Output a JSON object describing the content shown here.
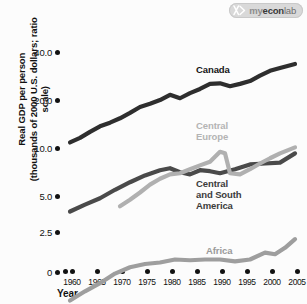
{
  "logo": {
    "icon": "myeconlab-mark-icon",
    "text_my": "my",
    "text_econ": "econ",
    "text_lab": "lab"
  },
  "chart_data": {
    "type": "line",
    "title": "",
    "xlabel": "Year",
    "ylabel": "Real GDP per person\n(thousands of 2000 U.S. dollars; ratio scale)",
    "ylabel_line1": "Real GDP per person",
    "ylabel_line2": "(thousands of 2000 U.S. dollars; ratio scale)",
    "scale": "ratio (logarithmic) y-axis",
    "grid": false,
    "legend_position": "inline labels next to series",
    "ytick_labels": [
      "0",
      "2.5",
      "5.0",
      "10.0",
      "20.0",
      "40.0"
    ],
    "ytick_values": [
      0,
      2.5,
      5.0,
      10.0,
      20.0,
      40.0
    ],
    "ylim": [
      0,
      40
    ],
    "xtick_labels": [
      "1960",
      "1965",
      "1970",
      "1975",
      "1980",
      "1985",
      "1990",
      "1995",
      "2000",
      "2005"
    ],
    "x": [
      1960,
      1965,
      1970,
      1975,
      1980,
      1985,
      1990,
      1995,
      2000,
      2005
    ],
    "xlim": [
      1960,
      2005
    ],
    "series": [
      {
        "name": "Canada",
        "color": "#2e2e2e",
        "x": [
          1960,
          1962,
          1964,
          1966,
          1968,
          1970,
          1972,
          1974,
          1976,
          1978,
          1980,
          1982,
          1984,
          1986,
          1988,
          1990,
          1992,
          1994,
          1996,
          1998,
          2000,
          2002,
          2005
        ],
        "values": [
          10.3,
          11.0,
          12.0,
          13.0,
          13.7,
          14.6,
          15.8,
          17.2,
          18.0,
          19.0,
          20.5,
          19.5,
          21.0,
          22.3,
          24.0,
          24.2,
          23.2,
          24.0,
          25.0,
          27.0,
          29.0,
          30.2,
          32.0
        ]
      },
      {
        "name": "Central Europe",
        "color": "#b0b0b0",
        "x": [
          1970,
          1972,
          1974,
          1976,
          1978,
          1980,
          1982,
          1984,
          1986,
          1988,
          1990,
          1991,
          1992,
          1994,
          1996,
          1998,
          2000,
          2002,
          2005
        ],
        "values": [
          4.1,
          4.5,
          5.0,
          5.6,
          6.1,
          6.5,
          6.6,
          7.0,
          7.4,
          7.8,
          9.0,
          8.8,
          6.6,
          6.5,
          7.0,
          7.6,
          8.2,
          8.8,
          9.6
        ]
      },
      {
        "name": "Central and South America",
        "color": "#4a4a4a",
        "x": [
          1960,
          1963,
          1966,
          1969,
          1972,
          1975,
          1978,
          1980,
          1982,
          1984,
          1986,
          1988,
          1990,
          1993,
          1996,
          1999,
          2002,
          2005
        ],
        "values": [
          3.8,
          4.2,
          4.6,
          5.2,
          5.8,
          6.4,
          6.9,
          7.1,
          6.7,
          6.5,
          6.9,
          6.8,
          6.6,
          7.0,
          7.5,
          7.6,
          7.7,
          8.8
        ]
      },
      {
        "name": "Africa",
        "color": "#9e9e9e",
        "x": [
          1960,
          1963,
          1966,
          1969,
          1972,
          1975,
          1978,
          1981,
          1984,
          1987,
          1990,
          1993,
          1996,
          1999,
          2001,
          2003,
          2005
        ],
        "values": [
          1.05,
          1.2,
          1.35,
          1.55,
          1.7,
          1.78,
          1.82,
          1.9,
          1.88,
          1.9,
          1.9,
          1.85,
          1.9,
          2.1,
          2.05,
          2.25,
          2.55
        ]
      }
    ]
  }
}
